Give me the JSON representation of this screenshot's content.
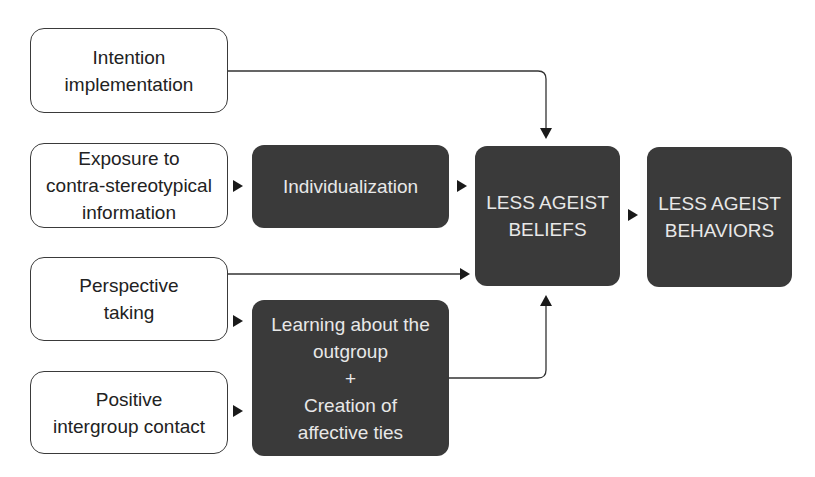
{
  "colors": {
    "dark_box": "#3a3a3a",
    "dark_text": "#e8e8e8",
    "light_border": "#3a3a3a",
    "light_text": "#222222",
    "connector": "#333333"
  },
  "inputs": [
    {
      "id": "intention",
      "lines": [
        "Intention",
        "implementation"
      ]
    },
    {
      "id": "exposure",
      "lines": [
        "Exposure to",
        "contra-stereotypical",
        "information"
      ]
    },
    {
      "id": "perspective",
      "lines": [
        "Perspective",
        "taking"
      ]
    },
    {
      "id": "contact",
      "lines": [
        "Positive",
        "intergroup contact"
      ]
    }
  ],
  "mediators": [
    {
      "id": "individualization",
      "lines": [
        "Individualization"
      ]
    },
    {
      "id": "learning",
      "lines": [
        "Learning about the",
        "outgroup",
        "+",
        "Creation of",
        "affective ties"
      ]
    }
  ],
  "outcomes": [
    {
      "id": "beliefs",
      "lines": [
        "LESS AGEIST",
        "BELIEFS"
      ]
    },
    {
      "id": "behaviors",
      "lines": [
        "LESS AGEIST",
        "BEHAVIORS"
      ]
    }
  ],
  "edges": [
    {
      "from": "intention",
      "to": "beliefs"
    },
    {
      "from": "exposure",
      "to": "individualization"
    },
    {
      "from": "individualization",
      "to": "beliefs"
    },
    {
      "from": "perspective",
      "to": "beliefs"
    },
    {
      "from": "perspective",
      "to": "learning"
    },
    {
      "from": "contact",
      "to": "learning"
    },
    {
      "from": "learning",
      "to": "beliefs"
    },
    {
      "from": "beliefs",
      "to": "behaviors"
    }
  ]
}
